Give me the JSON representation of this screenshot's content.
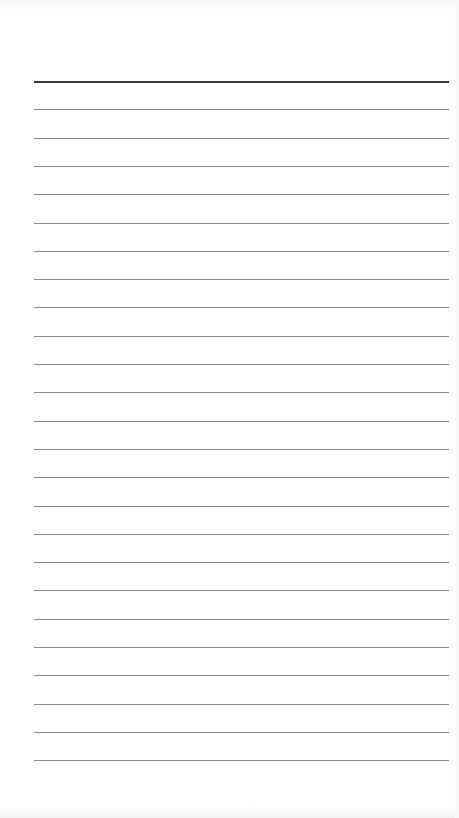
{
  "page": {
    "type": "lined-notepad",
    "background_color": "#ffffff",
    "line_color": "#8a8a8a",
    "header_line_color": "#3a3a3a",
    "line_count": 25,
    "line_start_y": 81,
    "line_spacing": 28.3,
    "line_left": 34,
    "line_width": 415
  }
}
